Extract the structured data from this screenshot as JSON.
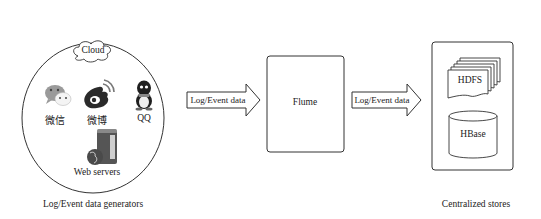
{
  "generators": {
    "caption": "Log/Event data generators",
    "cloud_label": "Cloud",
    "apps": [
      {
        "name": "微信",
        "icon": "wechat-icon"
      },
      {
        "name": "微博",
        "icon": "weibo-icon"
      },
      {
        "name": "QQ",
        "icon": "qq-penguin-icon"
      }
    ],
    "servers_label": "Web servers"
  },
  "arrows": [
    {
      "label": "Log/Event data"
    },
    {
      "label": "Log/Event data"
    }
  ],
  "flume": {
    "label": "Flume"
  },
  "stores": {
    "caption": "Centralized stores",
    "hdfs_label": "HDFS",
    "hbase_label": "HBase"
  },
  "colors": {
    "stroke": "#333333",
    "icon_gray": "#888888",
    "icon_dark": "#222222"
  }
}
